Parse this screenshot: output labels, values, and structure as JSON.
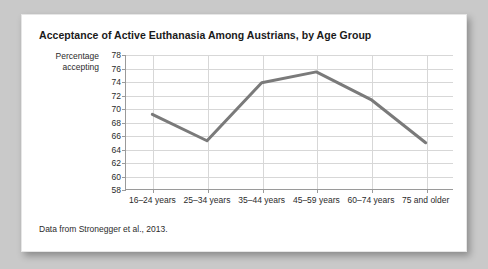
{
  "figure": {
    "title": "Acceptance of Active Euthanasia Among Austrians, by Age Group",
    "source_note": "Data from Stronegger et al., 2013.",
    "y_axis_title_line1": "Percentage",
    "y_axis_title_line2": "accepting",
    "line_color": "#7a7a7a",
    "grid_color": "#d7d7d7",
    "axis_color": "#9a9a9a",
    "card_background": "#ffffff",
    "page_background": "#c9c9c9"
  },
  "chart_data": {
    "type": "line",
    "title": "Acceptance of Active Euthanasia Among Austrians, by Age Group",
    "xlabel": "",
    "ylabel": "Percentage accepting",
    "categories": [
      "16–24 years",
      "25–34 years",
      "35–44 years",
      "45–59 years",
      "60–74 years",
      "75 and older"
    ],
    "values": [
      69.2,
      65.3,
      73.9,
      75.5,
      71.4,
      65.0
    ],
    "ylim": [
      58,
      78
    ],
    "ytick_step": 2,
    "yticks": [
      78,
      76,
      74,
      72,
      70,
      68,
      66,
      64,
      62,
      60,
      58
    ],
    "grid": "horizontal-and-vertical",
    "legend": "none",
    "series_name": "Percentage accepting"
  }
}
